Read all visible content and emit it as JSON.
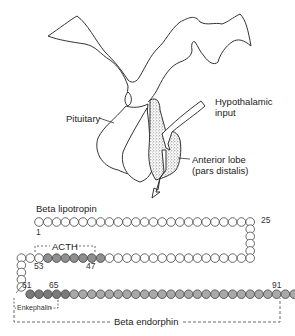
{
  "labels": {
    "pituitary": "Pituitary",
    "hypothalamic_input_line1": "Hypothalamic",
    "hypothalamic_input_line2": "input",
    "anterior_lobe_line1": "Anterior lobe",
    "anterior_lobe_line2": "(pars distalis)",
    "beta_lipotropin": "Beta lipotropin",
    "acth": "ACTH",
    "enkephalin": "Enkephalin",
    "beta_endorphin": "Beta endorphin"
  },
  "residue_numbers": {
    "n1": "1",
    "n25": "25",
    "n53": "53",
    "n47": "47",
    "n61": "61",
    "n65": "65",
    "n91": "91"
  },
  "colors": {
    "outline": "#333333",
    "residue_white": "#ffffff",
    "residue_acth": "#8f8f8f",
    "residue_enkephalin": "#7a7a7a",
    "residue_endorphin": "#a9a9a9",
    "stipple": "#555555"
  },
  "chain": {
    "total_residues": 91,
    "rows": [
      {
        "name": "top-row",
        "from": 1,
        "to": 25
      },
      {
        "name": "right-turn",
        "from": 26,
        "to": 29
      },
      {
        "name": "middle-row",
        "from": 30,
        "to": 56
      },
      {
        "name": "left-turn",
        "from": 57,
        "to": 60
      },
      {
        "name": "bottom-row",
        "from": 61,
        "to": 91
      }
    ],
    "segments": [
      {
        "name": "ACTH",
        "from": 47,
        "to": 53
      },
      {
        "name": "Enkephalin",
        "from": 61,
        "to": 65
      },
      {
        "name": "Beta endorphin",
        "from": 61,
        "to": 91
      }
    ]
  }
}
